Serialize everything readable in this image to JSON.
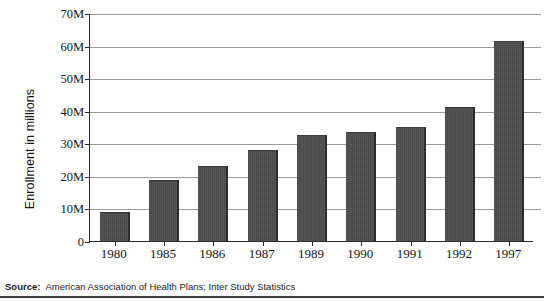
{
  "chart_data": {
    "type": "bar",
    "title": "",
    "xlabel": "",
    "ylabel": "Enrollment in millions",
    "categories": [
      "1980",
      "1985",
      "1986",
      "1987",
      "1989",
      "1990",
      "1991",
      "1992",
      "1997"
    ],
    "values": [
      9,
      18.7,
      23,
      28,
      32.5,
      33.5,
      35,
      41,
      61.5
    ],
    "ylim": [
      0,
      70
    ],
    "y_ticks": [
      0,
      10,
      20,
      30,
      40,
      50,
      60,
      70
    ],
    "y_tick_labels": [
      "0",
      "10M",
      "20M",
      "30M",
      "40M",
      "50M",
      "60M",
      "70M"
    ],
    "grid": true,
    "legend": "none",
    "series": [
      {
        "name": "HMO enrollment",
        "values": [
          9,
          18.7,
          23,
          28,
          32.5,
          33.5,
          35,
          41,
          61.5
        ]
      }
    ],
    "bar_color": "#4b4b4b"
  },
  "footer": {
    "source_label": "Source:",
    "source_text": "American Association of Health Plans; Inter Study Statistics"
  },
  "colors": {
    "bar": "#4b4b4b",
    "bar_edge": "#2c2c2c",
    "gridline": "#9a9a9a",
    "axis": "#2b2b2b",
    "text": "#131313",
    "background": "#ffffff",
    "footer_rule": "#3d3d3d"
  }
}
